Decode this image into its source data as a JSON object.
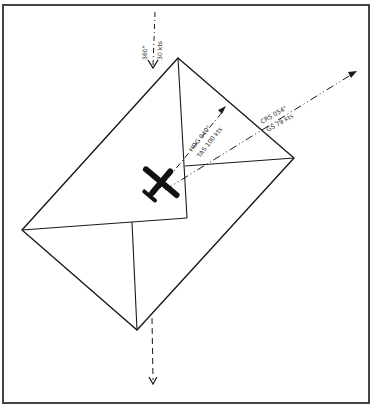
{
  "figure": {
    "colors": {
      "ink": "#1a1a1a",
      "frame": "#444444",
      "background": "#ffffff"
    }
  },
  "wind": {
    "direction": "360°",
    "speed": "30 kts",
    "icon": "arrow-down-icon"
  },
  "heading": {
    "hdg": "HDG 040°",
    "tas": "TAS 100 kts"
  },
  "course": {
    "crs": "CRS 054°",
    "gs": "GS 79 kts"
  },
  "aircraft": {
    "icon": "airplane-icon"
  }
}
